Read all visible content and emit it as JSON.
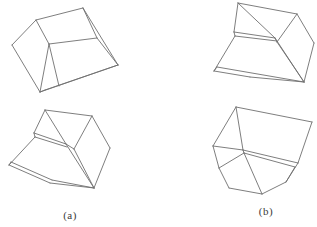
{
  "figure": {
    "background_color": "#ffffff",
    "line_color": "#6f6f6f",
    "labels": {
      "a": "(a)",
      "b": "(b)"
    },
    "shapes": [
      {
        "name": "crystal-a-upper",
        "description": "wireframe rhombohedral crystal, upper drawing of group (a)",
        "segments": [
          [
            12,
            45,
            36,
            20
          ],
          [
            36,
            20,
            83,
            8
          ],
          [
            12,
            45,
            40,
            92
          ],
          [
            36,
            20,
            49,
            44
          ],
          [
            49,
            44,
            97,
            38
          ],
          [
            83,
            8,
            97,
            38
          ],
          [
            83,
            8,
            118,
            65
          ],
          [
            97,
            38,
            118,
            65
          ],
          [
            49,
            44,
            40,
            92
          ],
          [
            49,
            44,
            59,
            86
          ],
          [
            40,
            92,
            118,
            65
          ],
          [
            45,
            90,
            118,
            65
          ],
          [
            40,
            92,
            45,
            90
          ]
        ]
      },
      {
        "name": "crystal-a-lower",
        "description": "wireframe rhombohedral crystal, lower drawing of group (a)",
        "segments": [
          [
            45,
            110,
            92,
            116
          ],
          [
            92,
            116,
            110,
            148
          ],
          [
            110,
            148,
            94,
            188
          ],
          [
            9,
            165,
            50,
            183
          ],
          [
            50,
            183,
            94,
            188
          ],
          [
            11,
            162,
            52,
            180
          ],
          [
            52,
            180,
            94,
            188
          ],
          [
            9,
            165,
            11,
            162
          ],
          [
            9,
            165,
            35,
            137
          ],
          [
            34,
            133,
            45,
            110
          ],
          [
            34,
            133,
            35,
            137
          ],
          [
            34,
            133,
            66,
            144
          ],
          [
            35,
            137,
            67,
            147
          ],
          [
            45,
            110,
            66,
            144
          ],
          [
            92,
            116,
            74,
            149
          ],
          [
            66,
            144,
            74,
            149
          ],
          [
            66,
            144,
            94,
            188
          ],
          [
            74,
            149,
            94,
            188
          ]
        ]
      },
      {
        "name": "crystal-b-upper",
        "description": "wireframe rhombohedral crystal, upper drawing of group (b)",
        "segments": [
          [
            238,
            3,
            297,
            14
          ],
          [
            297,
            14,
            314,
            43
          ],
          [
            314,
            43,
            304,
            82
          ],
          [
            214,
            71,
            250,
            77
          ],
          [
            250,
            77,
            304,
            82
          ],
          [
            217,
            67,
            304,
            82
          ],
          [
            214,
            71,
            217,
            67
          ],
          [
            214,
            71,
            235,
            36
          ],
          [
            234,
            32,
            238,
            3
          ],
          [
            234,
            32,
            235,
            36
          ],
          [
            234,
            32,
            275,
            38
          ],
          [
            235,
            36,
            277,
            41
          ],
          [
            238,
            3,
            275,
            38
          ],
          [
            297,
            14,
            277,
            42
          ],
          [
            275,
            38,
            277,
            42
          ],
          [
            275,
            38,
            304,
            82
          ],
          [
            277,
            42,
            304,
            82
          ]
        ]
      },
      {
        "name": "crystal-b-lower",
        "description": "wireframe rhombohedral crystal viewed from below, lower drawing of group (b)",
        "segments": [
          [
            236,
            107,
            312,
            122
          ],
          [
            236,
            107,
            213,
            146
          ],
          [
            213,
            146,
            219,
            168
          ],
          [
            219,
            168,
            229,
            188
          ],
          [
            229,
            188,
            262,
            194
          ],
          [
            262,
            194,
            286,
            182
          ],
          [
            286,
            182,
            298,
            163
          ],
          [
            312,
            122,
            298,
            163
          ],
          [
            236,
            107,
            243,
            150
          ],
          [
            213,
            146,
            243,
            150
          ],
          [
            243,
            150,
            244,
            153
          ],
          [
            219,
            168,
            244,
            153
          ],
          [
            243,
            150,
            298,
            163
          ],
          [
            244,
            153,
            295,
            167
          ],
          [
            295,
            167,
            286,
            182
          ],
          [
            244,
            153,
            262,
            194
          ]
        ]
      }
    ]
  }
}
